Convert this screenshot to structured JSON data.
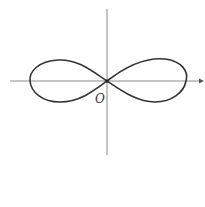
{
  "diagram": {
    "type": "lemniscate",
    "origin_label": "O",
    "axes": {
      "x_axis": {
        "from": [
          10,
          81
        ],
        "to": [
          204,
          81
        ],
        "arrow": true
      },
      "y_axis": {
        "from": [
          107,
          9
        ],
        "to": [
          107,
          155
        ],
        "arrow": false
      }
    },
    "curve": {
      "center": [
        107,
        81
      ],
      "half_width": 78,
      "stroke_color": "#333333"
    },
    "colors": {
      "axis": "#8a8a8a",
      "curve": "#333333",
      "background": "#ffffff"
    }
  }
}
